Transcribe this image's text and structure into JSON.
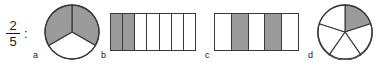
{
  "prompt": {
    "fraction_numerator": "2",
    "fraction_denominator": "5",
    "separator": ":"
  },
  "colors": {
    "shade": "#9b9b9b",
    "outline": "#3a3a3a",
    "text": "#1a1a1a",
    "background": "#ffffff"
  },
  "options": [
    {
      "label": "a",
      "figure": "circle",
      "total_parts": 3,
      "shaded_parts": 2,
      "shaded_indices": [
        0,
        2
      ],
      "fraction_shown": "2/3"
    },
    {
      "label": "b",
      "figure": "bar",
      "total_parts": 7,
      "shaded_parts": 2,
      "shaded_indices": [
        0,
        1
      ],
      "fraction_shown": "2/7"
    },
    {
      "label": "c",
      "figure": "bar",
      "total_parts": 5,
      "shaded_parts": 2,
      "shaded_indices": [
        1,
        3
      ],
      "fraction_shown": "2/5"
    },
    {
      "label": "d",
      "figure": "circle",
      "total_parts": 5,
      "shaded_parts": 1,
      "shaded_indices": [
        0
      ],
      "fraction_shown": "1/5"
    }
  ]
}
